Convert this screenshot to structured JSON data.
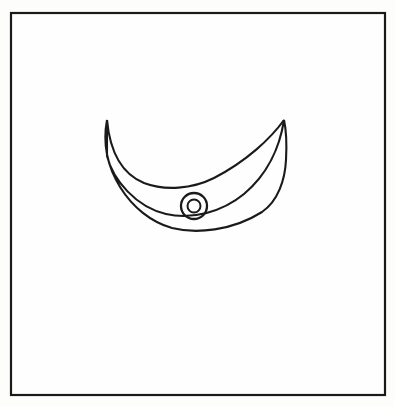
{
  "image": {
    "kind": "line-drawing",
    "subject": "crescent-with-concentric-circles",
    "background_color": "#fdfdfc",
    "paper_color": "#fefefe",
    "ink_color": "#1a1a1a",
    "width": 395,
    "height": 407
  },
  "frame": {
    "name": "border-frame",
    "x": 11,
    "y": 13,
    "width": 374,
    "height": 382,
    "stroke_width": 2.2,
    "stroke_color": "#1a1a1a",
    "fill_color": "#fefefe"
  },
  "crescent": {
    "name": "crescent-shape",
    "left_tip_x": 107,
    "left_tip_y": 120,
    "right_tip_x": 284,
    "right_tip_y": 120,
    "outer_bottom_y": 230,
    "inner_bottom_y": 185,
    "leftmost_x": 105,
    "rightmost_x": 286,
    "stroke_width": 2.1,
    "stroke_color": "#1a1a1a",
    "fill_color": "#fefefe",
    "outer_path": "M 107 120 C 98 168 130 216 172 228 C 196 234 232 231 262 212 C 278 201 285 180 286 160 C 287 142 286 129 284 120 C 280 146 268 174 244 194 C 222 212 192 220 166 214 C 136 207 113 180 107 156 Z",
    "inner_path": "M 107 120 C 110 152 122 172 142 181 C 162 190 190 188 212 177 C 245 160 270 136 284 120 C 280 146 268 174 244 194 C 222 212 192 220 166 214 C 136 207 113 180 107 156 Z"
  },
  "rings": {
    "name": "concentric-circles",
    "center_x": 194,
    "center_y": 206,
    "outer_radius": 13,
    "inner_radius": 6.5,
    "stroke_color": "#1a1a1a",
    "outer_stroke_width": 2.3,
    "inner_stroke_width": 2.0,
    "fill_color": "#fefefe"
  }
}
